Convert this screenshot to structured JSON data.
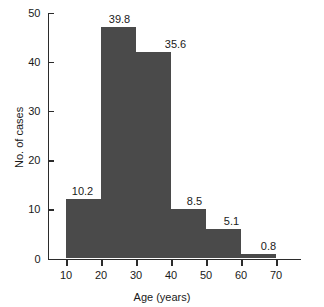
{
  "chart_data": {
    "type": "bar",
    "title": "",
    "xlabel": "Age (years)",
    "ylabel": "No. of cases",
    "categories": [
      "10–20",
      "20–30",
      "30–40",
      "40–50",
      "50–60",
      "60–70"
    ],
    "bin_edges": [
      10,
      20,
      30,
      40,
      50,
      60,
      70
    ],
    "values": [
      12,
      47,
      42,
      10,
      6,
      1
    ],
    "data_labels": [
      "10.2",
      "39.8",
      "35.6",
      "8.5",
      "5.1",
      "0.8"
    ],
    "data_label_units": "percent",
    "xlim": [
      5,
      77
    ],
    "ylim": [
      0,
      50
    ],
    "xticks": [
      10,
      20,
      30,
      40,
      50,
      60,
      70
    ],
    "xtick_labels": [
      "10",
      "20",
      "30",
      "40",
      "50",
      "60",
      "70"
    ],
    "yticks": [
      0,
      10,
      20,
      30,
      40,
      50
    ],
    "ytick_labels": [
      "0",
      "10",
      "20",
      "30",
      "40",
      "50"
    ],
    "grid": false,
    "legend": false,
    "bar_color": "#4a4a4a",
    "axis_color": "#2b2b2b",
    "background_color": "#ffffff"
  }
}
